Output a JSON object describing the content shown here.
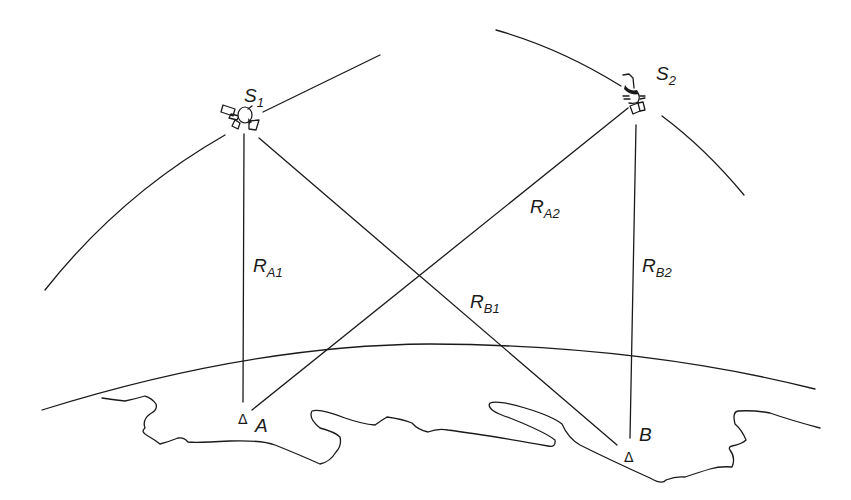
{
  "diagram": {
    "type": "satellite-ranging-geometry",
    "satellites": [
      {
        "id": "S1",
        "label_main": "S",
        "label_sub": "1",
        "x": 243,
        "y": 120
      },
      {
        "id": "S2",
        "label_main": "S",
        "label_sub": "2",
        "x": 633,
        "y": 100
      }
    ],
    "stations": [
      {
        "id": "A",
        "label": "A",
        "marker": "Δ",
        "x": 243,
        "y": 412
      },
      {
        "id": "B",
        "label": "B",
        "marker": "Δ",
        "x": 630,
        "y": 455
      }
    ],
    "ranges": [
      {
        "id": "RA1",
        "label_main": "R",
        "label_sub": "A1",
        "from": "S1",
        "to": "A"
      },
      {
        "id": "RB1",
        "label_main": "R",
        "label_sub": "B1",
        "from": "S1",
        "to": "B"
      },
      {
        "id": "RA2",
        "label_main": "R",
        "label_sub": "A2",
        "from": "S2",
        "to": "A"
      },
      {
        "id": "RB2",
        "label_main": "R",
        "label_sub": "B2",
        "from": "S2",
        "to": "B"
      }
    ],
    "elements": [
      "orbit-arc-1",
      "orbit-arc-2",
      "earth-surface-arc",
      "coastline"
    ],
    "colors": {
      "stroke": "#1a1a1a",
      "background": "#ffffff"
    }
  }
}
